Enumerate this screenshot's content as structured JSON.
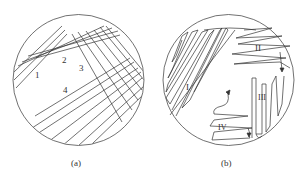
{
  "figure": {
    "panel_a": {
      "caption": "(a)",
      "description": "Petri dish with parallel streak lines in four groups",
      "region_labels": [
        "1",
        "2",
        "3",
        "4"
      ]
    },
    "panel_b": {
      "caption": "(b)",
      "description": "Petri dish with zig-zag streaks in four zones",
      "region_labels": [
        "I",
        "II",
        "III",
        "IV"
      ]
    },
    "colors": {
      "line": "#333333",
      "background": "#ffffff"
    }
  }
}
